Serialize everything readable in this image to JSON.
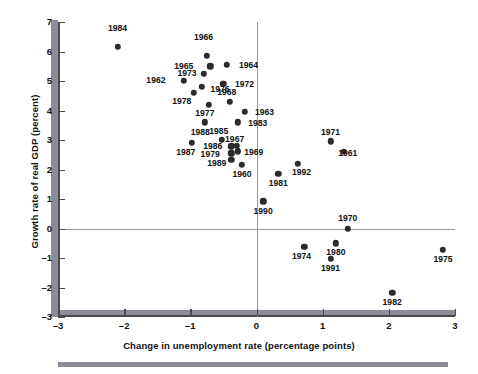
{
  "chart_data": {
    "type": "scatter",
    "title": "",
    "xlabel": "Change in unemployment rate (percentage points)",
    "ylabel": "Growth rate of real GDP (percent)",
    "xlim": [
      -3,
      3
    ],
    "ylim": [
      -3,
      7
    ],
    "xticks": [
      -3,
      -2,
      -1,
      0,
      1,
      2,
      3
    ],
    "xticklabels": [
      "–3",
      "–2",
      "–1",
      "0",
      "1",
      "2",
      "3"
    ],
    "yticks": [
      -3,
      -2,
      -1,
      0,
      1,
      2,
      3,
      4,
      5,
      6,
      7
    ],
    "yticklabels": [
      "–3",
      "–2",
      "–1",
      "0",
      "1",
      "2",
      "3",
      "4",
      "5",
      "6",
      "7"
    ],
    "grid": false,
    "legend": null,
    "zero_lines": {
      "vertical_x": 0,
      "horizontal_y": 0
    },
    "point_color": "#2b2b2b",
    "axis_color": "#4a4a4a",
    "band_color": "#8c8c99",
    "points": [
      {
        "label": "1984",
        "x": -2.1,
        "y": 6.15,
        "lx": -2.1,
        "ly": 6.8
      },
      {
        "label": "1966",
        "x": -0.75,
        "y": 5.85,
        "lx": -0.8,
        "ly": 6.48
      },
      {
        "label": "1964",
        "x": -0.45,
        "y": 5.55,
        "lx": -0.12,
        "ly": 5.55
      },
      {
        "label": "1965",
        "x": -0.7,
        "y": 5.5,
        "lx": -1.1,
        "ly": 5.5
      },
      {
        "label": "1973",
        "x": -0.8,
        "y": 5.25,
        "lx": -1.05,
        "ly": 5.28
      },
      {
        "label": "1962",
        "x": -1.1,
        "y": 5.0,
        "lx": -1.52,
        "ly": 5.02
      },
      {
        "label": "1972",
        "x": -0.5,
        "y": 4.9,
        "lx": -0.18,
        "ly": 4.9
      },
      {
        "label": "1976",
        "x": -0.83,
        "y": 4.8,
        "lx": -0.55,
        "ly": 4.72
      },
      {
        "label": "1978",
        "x": -0.95,
        "y": 4.6,
        "lx": -1.13,
        "ly": 4.32
      },
      {
        "label": "1968",
        "x": -0.4,
        "y": 4.3,
        "lx": -0.45,
        "ly": 4.62
      },
      {
        "label": "1977",
        "x": -0.72,
        "y": 4.2,
        "lx": -0.78,
        "ly": 3.92
      },
      {
        "label": "1963",
        "x": -0.18,
        "y": 3.95,
        "lx": 0.12,
        "ly": 3.95
      },
      {
        "label": "1983",
        "x": -0.28,
        "y": 3.6,
        "lx": 0.02,
        "ly": 3.58
      },
      {
        "label": "1988",
        "x": -0.78,
        "y": 3.6,
        "lx": -0.85,
        "ly": 3.28
      },
      {
        "label": "1985",
        "x": -0.52,
        "y": 3.0,
        "lx": -0.57,
        "ly": 3.3
      },
      {
        "label": "1971",
        "x": 1.12,
        "y": 2.95,
        "lx": 1.12,
        "ly": 3.28
      },
      {
        "label": "1967",
        "x": -0.3,
        "y": 2.8,
        "lx": -0.33,
        "ly": 3.05
      },
      {
        "label": "1961",
        "x": 1.32,
        "y": 2.6,
        "lx": 1.38,
        "ly": 2.55
      },
      {
        "label": "1986",
        "x": -0.38,
        "y": 2.78,
        "lx": -0.66,
        "ly": 2.78
      },
      {
        "label": "1987",
        "x": -0.98,
        "y": 2.9,
        "lx": -1.07,
        "ly": 2.58
      },
      {
        "label": "1969",
        "x": -0.28,
        "y": 2.62,
        "lx": -0.04,
        "ly": 2.58
      },
      {
        "label": "1979",
        "x": -0.38,
        "y": 2.55,
        "lx": -0.7,
        "ly": 2.52
      },
      {
        "label": "1989",
        "x": -0.38,
        "y": 2.32,
        "lx": -0.6,
        "ly": 2.22
      },
      {
        "label": "1960",
        "x": -0.22,
        "y": 2.15,
        "lx": -0.22,
        "ly": 1.86
      },
      {
        "label": "1992",
        "x": 0.62,
        "y": 2.2,
        "lx": 0.68,
        "ly": 1.9
      },
      {
        "label": "1981",
        "x": 0.33,
        "y": 1.85,
        "lx": 0.33,
        "ly": 1.55
      },
      {
        "label": "1990",
        "x": 0.1,
        "y": 0.92,
        "lx": 0.1,
        "ly": 0.6
      },
      {
        "label": "1970",
        "x": 1.38,
        "y": 0.0,
        "lx": 1.38,
        "ly": 0.34
      },
      {
        "label": "1980",
        "x": 1.2,
        "y": -0.5,
        "lx": 1.2,
        "ly": -0.8
      },
      {
        "label": "1974",
        "x": 0.72,
        "y": -0.62,
        "lx": 0.68,
        "ly": -0.93
      },
      {
        "label": "1975",
        "x": 2.82,
        "y": -0.72,
        "lx": 2.82,
        "ly": -1.05
      },
      {
        "label": "1991",
        "x": 1.12,
        "y": -1.02,
        "lx": 1.12,
        "ly": -1.34
      },
      {
        "label": "1982",
        "x": 2.05,
        "y": -2.18,
        "lx": 2.05,
        "ly": -2.5
      }
    ]
  }
}
